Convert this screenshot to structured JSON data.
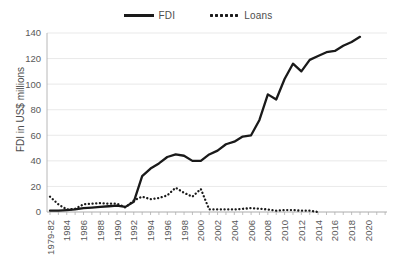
{
  "chart_data": {
    "type": "line",
    "title": "",
    "xlabel": "",
    "ylabel": "FDI in US$ millions",
    "ylim": [
      0,
      140
    ],
    "ytick_values": [
      0,
      20,
      40,
      60,
      80,
      100,
      120,
      140
    ],
    "ytick_labels": [
      "0",
      "20",
      "40",
      "60",
      "80",
      "100",
      "120",
      "140"
    ],
    "grid": true,
    "legend_position": "top-center",
    "x": [
      "1979-82",
      "1983",
      "1984",
      "1985",
      "1986",
      "1987",
      "1988",
      "1989",
      "1990",
      "1991",
      "1992",
      "1993",
      "1994",
      "1995",
      "1996",
      "1997",
      "1998",
      "1999",
      "2000",
      "2001",
      "2002",
      "2003",
      "2004",
      "2005",
      "2006",
      "2007",
      "2008",
      "2009",
      "2010",
      "2011",
      "2012",
      "2013",
      "2014",
      "2015",
      "2016",
      "2017",
      "2018",
      "2019"
    ],
    "xtick_labels": [
      "1979-82",
      "1984",
      "1986",
      "1988",
      "1990",
      "1992",
      "1994",
      "1996",
      "1998",
      "2000",
      "2002",
      "2004",
      "2006",
      "2008",
      "2010",
      "2012",
      "2014",
      "2016",
      "2018",
      "2020"
    ],
    "series": [
      {
        "name": "FDI",
        "style": "solid",
        "color": "#1a1a1a",
        "values": [
          1,
          1,
          1.5,
          2,
          3,
          3.5,
          4,
          4.5,
          5,
          4,
          8,
          28,
          34,
          38,
          43,
          45,
          44,
          40,
          40,
          45,
          48,
          53,
          55,
          59,
          60,
          72,
          92,
          88,
          104,
          116,
          110,
          119,
          122,
          125,
          126,
          130,
          133,
          137
        ]
      },
      {
        "name": "Loans",
        "style": "dotted",
        "color": "#1a1a1a",
        "values": [
          12,
          6,
          2,
          2.5,
          6,
          6.5,
          7,
          6.5,
          6.5,
          3.5,
          9,
          12,
          10,
          11,
          13,
          19,
          15,
          12,
          18,
          2,
          2,
          2,
          2,
          2.5,
          3,
          2.5,
          2,
          1,
          1.5,
          1.5,
          1,
          1,
          0,
          null,
          null,
          null,
          null,
          null
        ]
      }
    ]
  },
  "legend": {
    "entries": [
      {
        "label": "FDI",
        "swatch": "solid-line-swatch"
      },
      {
        "label": "Loans",
        "swatch": "dotted-line-swatch"
      }
    ]
  }
}
